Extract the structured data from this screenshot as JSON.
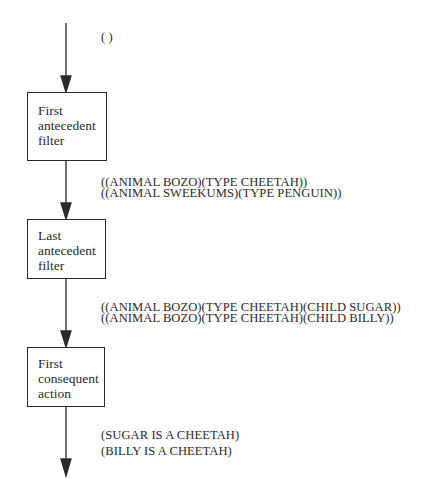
{
  "diagram": {
    "type": "flowchart",
    "direction": "top-to-bottom",
    "colors": {
      "stroke": "#2a2a2a",
      "background": "#ffffff",
      "text": "#2a2a2a"
    },
    "input_label": {
      "lines": [
        "( )"
      ]
    },
    "nodes": [
      {
        "id": "first-antecedent-filter",
        "lines": [
          "First",
          "antecedent",
          "filter"
        ]
      },
      {
        "id": "last-antecedent-filter",
        "lines": [
          "Last",
          "antecedent",
          "filter"
        ]
      },
      {
        "id": "first-consequent-action",
        "lines": [
          "First",
          "consequent",
          "action"
        ]
      }
    ],
    "edge_labels": [
      {
        "between": "first-antecedent-filter -> last-antecedent-filter",
        "lines": [
          "((ANIMAL BOZO)(TYPE CHEETAH))",
          "((ANIMAL SWEEKUMS)(TYPE PENGUIN))"
        ]
      },
      {
        "between": "last-antecedent-filter -> first-consequent-action",
        "lines": [
          "((ANIMAL BOZO)(TYPE CHEETAH)(CHILD SUGAR))",
          "((ANIMAL BOZO)(TYPE CHEETAH)(CHILD BILLY))"
        ]
      },
      {
        "between": "first-consequent-action -> output",
        "lines": [
          "(SUGAR IS A CHEETAH)",
          "(BILLY IS A CHEETAH)"
        ]
      }
    ]
  }
}
